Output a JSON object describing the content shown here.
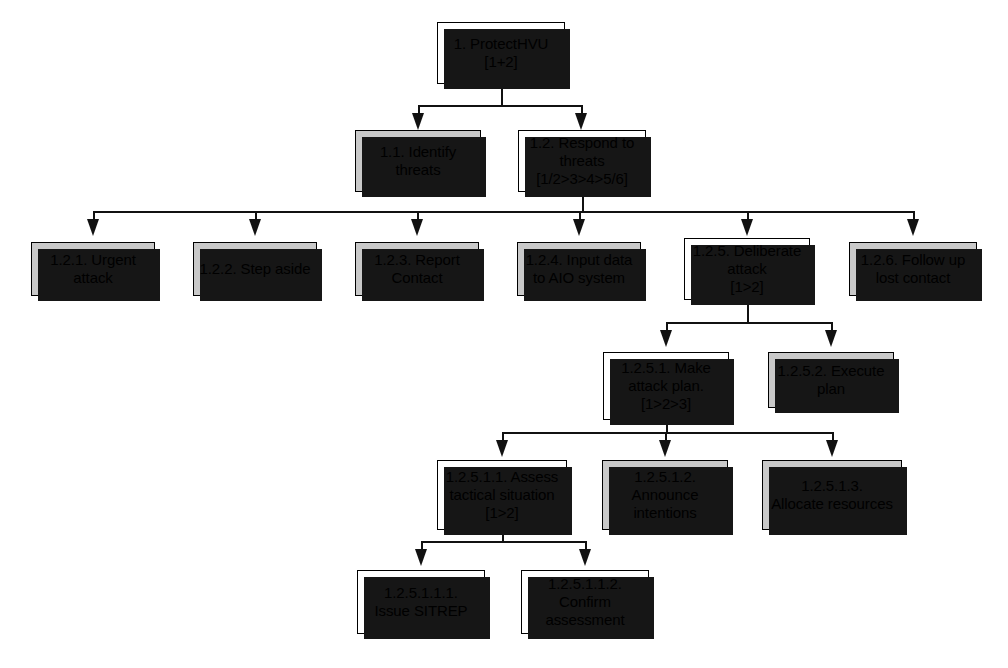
{
  "diagram": {
    "colors": {
      "shaded_node_fill": "#c9c9c9",
      "plain_node_fill": "#ffffff",
      "border": "#000000",
      "shadow": "#161616",
      "connector": "#111111",
      "background": "#ffffff"
    },
    "nodes": [
      {
        "id": "root",
        "label": "1. ProtectHVU\n[1+2]",
        "shaded": false,
        "x": 437,
        "y": 22,
        "w": 128,
        "h": 62
      },
      {
        "id": "n1_1",
        "label": "1.1. Identify\nthreats",
        "shaded": true,
        "x": 355,
        "y": 130,
        "w": 126,
        "h": 62
      },
      {
        "id": "n1_2",
        "label": "1.2. Respond to\nthreats\n[1/2>3>4>5/6]",
        "shaded": false,
        "x": 518,
        "y": 130,
        "w": 128,
        "h": 62
      },
      {
        "id": "n1_2_1",
        "label": "1.2.1. Urgent\nattack",
        "shaded": true,
        "x": 31,
        "y": 242,
        "w": 124,
        "h": 54
      },
      {
        "id": "n1_2_2",
        "label": "1.2.2. Step aside",
        "shaded": true,
        "x": 193,
        "y": 242,
        "w": 124,
        "h": 54
      },
      {
        "id": "n1_2_3",
        "label": "1.2.3. Report\nContact",
        "shaded": true,
        "x": 355,
        "y": 242,
        "w": 124,
        "h": 54
      },
      {
        "id": "n1_2_4",
        "label": "1.2.4. Input data\nto AIO system",
        "shaded": true,
        "x": 517,
        "y": 242,
        "w": 124,
        "h": 54
      },
      {
        "id": "n1_2_5",
        "label": "1.2.5. Deliberate\nattack\n[1>2]",
        "shaded": false,
        "x": 684,
        "y": 238,
        "w": 126,
        "h": 62
      },
      {
        "id": "n1_2_6",
        "label": "1.2.6. Follow up\nlost contact",
        "shaded": true,
        "x": 849,
        "y": 242,
        "w": 128,
        "h": 54
      },
      {
        "id": "n1_2_5_1",
        "label": "1.2.5.1. Make\nattack plan.\n[1>2>3]",
        "shaded": false,
        "x": 603,
        "y": 352,
        "w": 126,
        "h": 68
      },
      {
        "id": "n1_2_5_2",
        "label": "1.2.5.2. Execute\nplan",
        "shaded": true,
        "x": 768,
        "y": 352,
        "w": 126,
        "h": 56
      },
      {
        "id": "n1_2_5_1_1",
        "label": "1.2.5.1.1. Assess\ntactical situation\n[1>2]",
        "shaded": false,
        "x": 437,
        "y": 460,
        "w": 130,
        "h": 70
      },
      {
        "id": "n1_2_5_1_2",
        "label": "1.2.5.1.2.\nAnnounce\nintentions",
        "shaded": true,
        "x": 602,
        "y": 460,
        "w": 126,
        "h": 70
      },
      {
        "id": "n1_2_5_1_3",
        "label": "1.2.5.1.3.\nAllocate resources",
        "shaded": true,
        "x": 762,
        "y": 460,
        "w": 140,
        "h": 70
      },
      {
        "id": "n1_2_5_1_1_1",
        "label": "1.2.5.1.1.1.\nIssue SITREP",
        "shaded": false,
        "x": 357,
        "y": 570,
        "w": 128,
        "h": 64
      },
      {
        "id": "n1_2_5_1_1_2",
        "label": "1.2.5.1.1.2.\nConfirm\nassessment",
        "shaded": false,
        "x": 521,
        "y": 570,
        "w": 128,
        "h": 64
      }
    ],
    "connectors": {
      "level_1_to_2": {
        "stem_x": 501,
        "stem_top": 84,
        "bus_y": 105,
        "bus_left": 418,
        "bus_right": 581,
        "arrows_x": [
          418,
          581
        ]
      },
      "level_2_to_3": {
        "stem_x": 582,
        "stem_top": 192,
        "bus_y": 211,
        "bus_left": 93,
        "bus_right": 913,
        "arrows_x": [
          93,
          255,
          417,
          579,
          747,
          913
        ]
      },
      "level_1_2_5_children": {
        "stem_x": 747,
        "stem_top": 300,
        "bus_y": 322,
        "bus_left": 666,
        "bus_right": 831,
        "arrows_x": [
          666,
          831
        ]
      },
      "level_1_2_5_1_children": {
        "stem_x": 666,
        "stem_top": 420,
        "bus_y": 432,
        "bus_left": 502,
        "bus_right": 832,
        "arrows_x": [
          502,
          665,
          832
        ]
      },
      "level_1_2_5_1_1_children": {
        "stem_x": 502,
        "stem_top": 530,
        "bus_y": 541,
        "bus_left": 421,
        "bus_right": 585,
        "arrows_x": [
          421,
          585
        ]
      }
    }
  }
}
